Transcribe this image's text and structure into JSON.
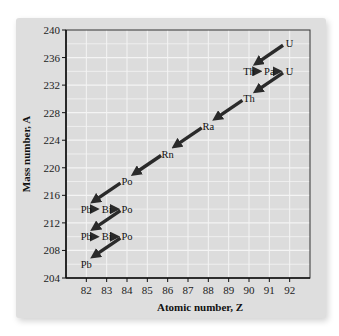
{
  "chart_data": {
    "type": "scatter",
    "title": "",
    "xlabel": "Atomic number, Z",
    "ylabel": "Mass number, A",
    "xlim": [
      81,
      93
    ],
    "ylim": [
      204,
      240
    ],
    "xticks": [
      82,
      83,
      84,
      85,
      86,
      87,
      88,
      89,
      90,
      91,
      92
    ],
    "yticks": [
      204,
      208,
      212,
      216,
      220,
      224,
      228,
      232,
      236,
      240
    ],
    "grid": true,
    "nodes": [
      {
        "label": "U",
        "Z": 92,
        "A": 238
      },
      {
        "label": "Th",
        "Z": 90,
        "A": 234
      },
      {
        "label": "Pa",
        "Z": 91,
        "A": 234
      },
      {
        "label": "U",
        "Z": 92,
        "A": 234
      },
      {
        "label": "Th",
        "Z": 90,
        "A": 230
      },
      {
        "label": "Ra",
        "Z": 88,
        "A": 226
      },
      {
        "label": "Rn",
        "Z": 86,
        "A": 222
      },
      {
        "label": "Po",
        "Z": 84,
        "A": 218
      },
      {
        "label": "Pb",
        "Z": 82,
        "A": 214
      },
      {
        "label": "Bi",
        "Z": 83,
        "A": 214
      },
      {
        "label": "Po",
        "Z": 84,
        "A": 214
      },
      {
        "label": "Pb",
        "Z": 82,
        "A": 210
      },
      {
        "label": "Bi",
        "Z": 83,
        "A": 210
      },
      {
        "label": "Po",
        "Z": 84,
        "A": 210
      },
      {
        "label": "Pb",
        "Z": 82,
        "A": 206
      }
    ],
    "decays": [
      {
        "from": 0,
        "to": 1,
        "type": "alpha"
      },
      {
        "from": 1,
        "to": 2,
        "type": "beta"
      },
      {
        "from": 2,
        "to": 3,
        "type": "beta"
      },
      {
        "from": 3,
        "to": 4,
        "type": "alpha"
      },
      {
        "from": 4,
        "to": 5,
        "type": "alpha"
      },
      {
        "from": 5,
        "to": 6,
        "type": "alpha"
      },
      {
        "from": 6,
        "to": 7,
        "type": "alpha"
      },
      {
        "from": 7,
        "to": 8,
        "type": "alpha"
      },
      {
        "from": 8,
        "to": 9,
        "type": "beta"
      },
      {
        "from": 9,
        "to": 10,
        "type": "beta"
      },
      {
        "from": 10,
        "to": 11,
        "type": "alpha"
      },
      {
        "from": 11,
        "to": 12,
        "type": "beta"
      },
      {
        "from": 12,
        "to": 13,
        "type": "beta"
      },
      {
        "from": 13,
        "to": 14,
        "type": "alpha"
      }
    ]
  },
  "colors": {
    "plot_background": "#dcdcdc",
    "gridline": "#f4f4f4",
    "arrow": "#2a2a2a",
    "axis": "#333333"
  }
}
